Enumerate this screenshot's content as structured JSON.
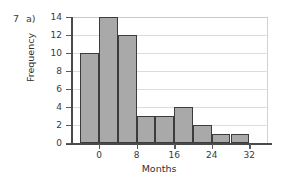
{
  "question": {
    "number": "7",
    "part": "a)"
  },
  "chart_data": {
    "type": "bar",
    "title": "",
    "subtitle": "",
    "xlabel": "Months",
    "ylabel": "Frequency",
    "categories": [
      "-4 to 0",
      "0 to 4",
      "4 to 8",
      "8 to 12",
      "12 to 16",
      "16 to 20",
      "20 to 24",
      "24 to 28",
      "28 to 32"
    ],
    "bin_edges": [
      -4,
      0,
      4,
      8,
      12,
      16,
      20,
      24,
      28,
      32
    ],
    "bin_width": 4,
    "values": [
      10,
      14,
      12,
      3,
      3,
      4,
      2,
      1,
      1
    ],
    "bar_labels": [
      "10",
      "14",
      "12",
      "3",
      "3",
      "4",
      "2",
      "1",
      "1"
    ],
    "xlim": [
      -6,
      36
    ],
    "ylim": [
      0,
      14
    ],
    "ytick_values": [
      0,
      2,
      4,
      6,
      8,
      10,
      12,
      14
    ],
    "ytick_labels": [
      "0",
      "2",
      "4",
      "6",
      "8",
      "10",
      "12",
      "14"
    ],
    "xtick_values": [
      0,
      8,
      16,
      24,
      32
    ],
    "xtick_labels": [
      "0",
      "8",
      "16",
      "24",
      "32"
    ],
    "grid": "horizontal",
    "legend": "none",
    "bar_color": "#a9a9a9",
    "bar_edge_color": "#3c3c3c",
    "grid_color": "#dcdcdc",
    "axis_color": "#4a4a4a",
    "background": "#ffffff"
  }
}
